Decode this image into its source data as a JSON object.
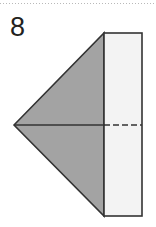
{
  "page": {
    "width": 156,
    "height": 227,
    "background_color": "#ffffff"
  },
  "top_rule": {
    "name": "dotted-divider",
    "style": "dotted",
    "color": "#b9b9b9",
    "y": 3
  },
  "figure": {
    "label": "8",
    "label_color": "#231f20",
    "triangle": {
      "name": "cone-silhouette",
      "fill_color": "#a3a3a3",
      "stroke_color": "#333333",
      "apex": {
        "x": 14,
        "y": 125
      },
      "top_right": {
        "x": 104,
        "y": 33
      },
      "bottom_right": {
        "x": 104,
        "y": 216
      }
    },
    "rectangle": {
      "name": "cylinder-silhouette",
      "fill_color": "#f3f3f3",
      "stroke_color": "#333333",
      "left": 104,
      "top": 33,
      "right": 142,
      "bottom": 216
    },
    "axis_line": {
      "name": "axis-of-symmetry",
      "color": "#333333",
      "y": 125,
      "solid_from_x": 14,
      "solid_to_x": 104,
      "dashed_from_x": 104,
      "dashed_to_x": 142,
      "dash_pattern": "6 3"
    }
  }
}
